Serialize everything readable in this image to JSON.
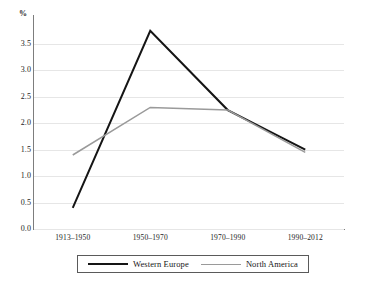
{
  "chart_data": {
    "type": "line",
    "title": "",
    "subtitle": "",
    "xlabel": "",
    "ylabel": "%",
    "ylim": [
      0.0,
      3.9
    ],
    "ytick_values": [
      0.0,
      0.5,
      1.0,
      1.5,
      2.0,
      2.5,
      3.0,
      3.5
    ],
    "ytick_labels": [
      "0.0",
      "0.5",
      "1.0",
      "1.5",
      "2.0",
      "2.5",
      "3.0",
      "3.5"
    ],
    "categories": [
      "1913–1950",
      "1950–1970",
      "1970–1990",
      "1990–2012"
    ],
    "grid": true,
    "grid_axis": "y",
    "legend_position": "bottom",
    "series": [
      {
        "name": "Western Europe",
        "color": "#151515",
        "width": 2,
        "values": [
          0.4,
          3.75,
          2.25,
          1.5
        ]
      },
      {
        "name": "North America",
        "color": "#9a9a9a",
        "width": 1.5,
        "values": [
          1.4,
          2.3,
          2.25,
          1.45
        ]
      }
    ]
  },
  "axes": {
    "y_unit_label": "%",
    "axis_color": "#7d7d7d",
    "grid_color": "#e6e6e6"
  },
  "legend": {
    "items": [
      {
        "label": "Western Europe",
        "color": "#151515"
      },
      {
        "label": "North America",
        "color": "#9a9a9a"
      }
    ]
  }
}
